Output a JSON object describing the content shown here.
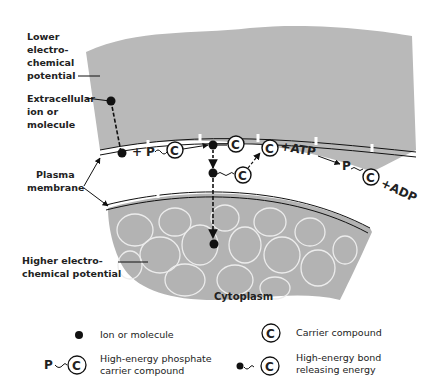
{
  "diagram": {
    "type": "active-transport-membrane",
    "labels": {
      "lower_potential": [
        "Lower",
        "electro-",
        "chemical",
        "potential"
      ],
      "extracellular": [
        "Extracellular",
        "ion  or",
        "molecule"
      ],
      "plasma_membrane": [
        "Plasma",
        "membrane"
      ],
      "higher_potential": [
        "Higher electro-",
        "chemical potential"
      ],
      "cytoplasm": "Cytoplasm"
    },
    "reaction": {
      "plus1": "+",
      "p": "P",
      "c": "C",
      "plus_atp": "+ATP",
      "p2": "P",
      "plus_adp": "+ADP"
    },
    "colors": {
      "extracellular_fill": "#b9b9b9",
      "cytoplasm_fill": "#b3b3b3",
      "cell_outline": "#e8e8e8",
      "ink": "#111111"
    }
  },
  "legend": [
    {
      "icon": "ion-dot",
      "label": [
        "Ion or molecule"
      ]
    },
    {
      "icon": "carrier-c",
      "label": [
        "Carrier compound"
      ]
    },
    {
      "icon": "phosphate-carrier",
      "prefix": "P",
      "label": [
        "High-energy phosphate",
        "carrier compound"
      ]
    },
    {
      "icon": "high-energy-bond",
      "label": [
        "High-energy bond",
        "releasing energy"
      ]
    }
  ]
}
